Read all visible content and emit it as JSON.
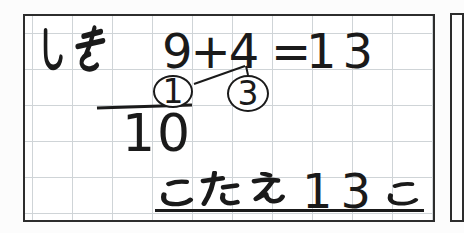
{
  "worksheet": {
    "formula_label": "しき",
    "formula_label_chars": [
      "し",
      "き"
    ],
    "equation": {
      "lhs": "9+4",
      "equals": "=",
      "result": "13"
    },
    "decomposition": {
      "first": "1",
      "second": "3",
      "partial_sum": "10"
    },
    "answer": {
      "label": "こたえ",
      "label_chars": [
        "こ",
        "た",
        "え"
      ],
      "value": "13",
      "counter": "こ"
    }
  },
  "colors": {
    "ink": "#1a1a1a",
    "panel_border": "#2d2d2d",
    "grid_line": "#cfd4d7",
    "paper": "#ffffff"
  }
}
